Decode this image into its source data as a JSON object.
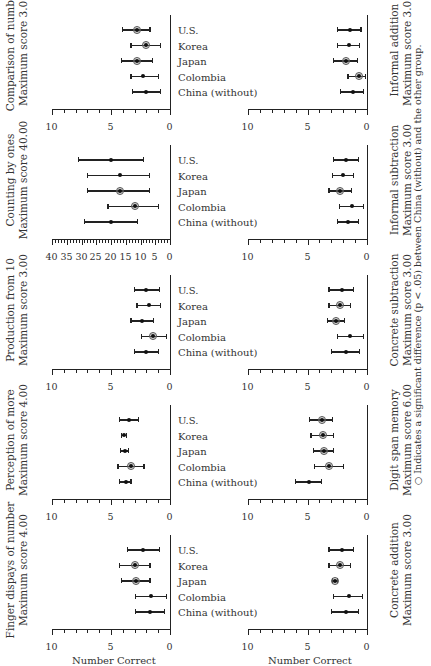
{
  "chart_data": [
    {
      "type": "scatter",
      "title": "Finger dispays of number",
      "subtitle": "Maximum score 4.00",
      "row": "top",
      "col": 0,
      "ylabel": "Number Correct",
      "ylim": [
        0,
        10
      ],
      "yticks": [
        0,
        5,
        10
      ],
      "categories": [
        "China (without)",
        "Colombia",
        "Japan",
        "Korea",
        "U.S."
      ],
      "values": [
        1.7,
        1.6,
        2.9,
        3.0,
        2.3
      ],
      "error_low": [
        0.5,
        0.3,
        1.7,
        1.7,
        0.9
      ],
      "error_high": [
        2.9,
        2.9,
        4.1,
        4.3,
        3.6
      ],
      "significant": [
        false,
        false,
        true,
        true,
        false
      ]
    },
    {
      "type": "scatter",
      "title": "Perception of more",
      "subtitle": "Maximum score 4.00",
      "row": "top",
      "col": 1,
      "ylim": [
        0,
        10
      ],
      "yticks": [
        0,
        5,
        10
      ],
      "categories": [
        "China (without)",
        "Colombia",
        "Japan",
        "Korea",
        "U.S."
      ],
      "values": [
        3.7,
        3.3,
        3.8,
        3.9,
        3.5
      ],
      "error_low": [
        3.3,
        2.2,
        3.5,
        3.7,
        2.7
      ],
      "error_high": [
        4.3,
        4.4,
        4.2,
        4.1,
        4.3
      ],
      "significant": [
        false,
        true,
        false,
        false,
        false
      ]
    },
    {
      "type": "scatter",
      "title": "Production from 10",
      "subtitle": "Maximum score 3.00",
      "row": "top",
      "col": 2,
      "ylim": [
        0,
        10
      ],
      "yticks": [
        0,
        5,
        10
      ],
      "categories": [
        "China (without)",
        "Colombia",
        "Japan",
        "Korea",
        "U.S."
      ],
      "values": [
        2.0,
        1.4,
        2.4,
        1.8,
        2.0
      ],
      "error_low": [
        1.0,
        0.3,
        1.4,
        0.8,
        0.9
      ],
      "error_high": [
        3.0,
        2.4,
        3.3,
        2.8,
        3.0
      ],
      "significant": [
        false,
        true,
        false,
        false,
        false
      ]
    },
    {
      "type": "scatter",
      "title": "Counting by ones",
      "subtitle": "Maximum score 40.00",
      "row": "top",
      "col": 3,
      "ylim": [
        0,
        40
      ],
      "yticks": [
        0,
        5,
        10,
        15,
        20,
        25,
        30,
        35,
        40
      ],
      "categories": [
        "China (without)",
        "Colombia",
        "Japan",
        "Korea",
        "U.S."
      ],
      "values": [
        20,
        12,
        17,
        17,
        20
      ],
      "error_low": [
        11,
        4,
        7,
        7,
        9
      ],
      "error_high": [
        29,
        21,
        28,
        28,
        31
      ],
      "significant": [
        false,
        true,
        true,
        false,
        false
      ]
    },
    {
      "type": "scatter",
      "title": "Comparison of number",
      "subtitle": "Maximum score 3.00",
      "row": "top",
      "col": 4,
      "ylim": [
        0,
        10
      ],
      "yticks": [
        0,
        5,
        10
      ],
      "categories": [
        "China (without)",
        "Colombia",
        "Japan",
        "Korea",
        "U.S."
      ],
      "values": [
        2.0,
        2.3,
        2.8,
        2.0,
        2.8
      ],
      "error_low": [
        0.8,
        1.0,
        1.5,
        0.8,
        1.7
      ],
      "error_high": [
        3.2,
        3.3,
        4.1,
        3.3,
        4.0
      ],
      "significant": [
        false,
        false,
        true,
        true,
        true
      ]
    },
    {
      "type": "scatter",
      "title": "Concrete addition",
      "subtitle": "Maximum score 3.00",
      "row": "bottom",
      "col": 0,
      "ylabel": "Number Correct",
      "ylim": [
        0,
        10
      ],
      "yticks": [
        0,
        5,
        10
      ],
      "categories": [
        "China (without)",
        "Colombia",
        "Japan",
        "Korea",
        "U.S."
      ],
      "values": [
        1.8,
        1.5,
        2.7,
        2.3,
        2.1
      ],
      "error_low": [
        0.7,
        0.4,
        2.5,
        1.4,
        1.1
      ],
      "error_high": [
        3.0,
        2.8,
        2.9,
        3.2,
        3.2
      ],
      "significant": [
        false,
        false,
        true,
        true,
        false
      ]
    },
    {
      "type": "scatter",
      "title": "Digit span memory",
      "subtitle": "Maximum score 6.00",
      "row": "bottom",
      "col": 1,
      "ylim": [
        0,
        10
      ],
      "yticks": [
        0,
        5,
        10
      ],
      "categories": [
        "China (without)",
        "Colombia",
        "Japan",
        "Korea",
        "U.S."
      ],
      "values": [
        4.9,
        3.2,
        3.6,
        3.7,
        3.8
      ],
      "error_low": [
        3.8,
        2.0,
        2.8,
        2.8,
        2.9
      ],
      "error_high": [
        6.0,
        4.4,
        4.5,
        4.7,
        4.8
      ],
      "significant": [
        false,
        true,
        true,
        true,
        true
      ]
    },
    {
      "type": "scatter",
      "title": "Concrete subtraction",
      "subtitle": "Maximum score 3.00",
      "row": "bottom",
      "col": 2,
      "ylim": [
        0,
        10
      ],
      "yticks": [
        0,
        5,
        10
      ],
      "categories": [
        "China (without)",
        "Colombia",
        "Japan",
        "Korea",
        "U.S."
      ],
      "values": [
        1.8,
        1.4,
        2.6,
        2.3,
        2.1
      ],
      "error_low": [
        0.6,
        0.3,
        1.9,
        1.4,
        1.1
      ],
      "error_high": [
        3.0,
        2.5,
        3.3,
        3.2,
        3.2
      ],
      "significant": [
        false,
        false,
        true,
        true,
        false
      ]
    },
    {
      "type": "scatter",
      "title": "Informal subtraction",
      "subtitle": "Maximum score 3.00",
      "row": "bottom",
      "col": 3,
      "ylim": [
        0,
        10
      ],
      "yticks": [
        0,
        5,
        10
      ],
      "categories": [
        "China (without)",
        "Colombia",
        "Japan",
        "Korea",
        "U.S."
      ],
      "values": [
        1.6,
        1.3,
        2.3,
        2.0,
        1.8
      ],
      "error_low": [
        0.7,
        0.3,
        1.3,
        1.1,
        0.7
      ],
      "error_high": [
        2.5,
        2.3,
        3.2,
        2.9,
        2.8
      ],
      "significant": [
        false,
        false,
        true,
        false,
        false
      ]
    },
    {
      "type": "scatter",
      "title": "Informal addition",
      "subtitle": "Maximum score 3.00",
      "row": "bottom",
      "col": 4,
      "ylim": [
        0,
        10
      ],
      "yticks": [
        0,
        5,
        10
      ],
      "categories": [
        "China (without)",
        "Colombia",
        "Japan",
        "Korea",
        "U.S."
      ],
      "values": [
        1.2,
        0.7,
        1.8,
        1.5,
        1.4
      ],
      "error_low": [
        0.3,
        0.1,
        0.8,
        0.6,
        0.5
      ],
      "error_high": [
        2.2,
        1.6,
        2.8,
        2.5,
        2.5
      ],
      "significant": [
        false,
        true,
        true,
        false,
        false
      ]
    }
  ],
  "figure": {
    "ylabel": "Number Correct",
    "footnote": "○  Indicates a significant difference (p < .05) between China (without) and the other group.",
    "colors": {
      "ink": "#222222",
      "ring": "#555555",
      "ring_fill": "#b0b0b0",
      "background": "#ffffff"
    }
  }
}
